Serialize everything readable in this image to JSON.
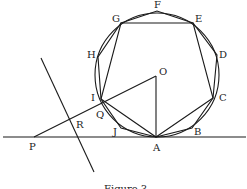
{
  "figure": {
    "caption": "Figure 3",
    "labels": {
      "F": "F",
      "G": "G",
      "E": "E",
      "H": "H",
      "D": "D",
      "O": "O",
      "I": "I",
      "C": "C",
      "Q": "Q",
      "R": "R",
      "J": "J",
      "B": "B",
      "P": "P",
      "A": "A"
    },
    "elements": [
      "circle centered at O tangent to line at A",
      "decagon A-B-C-D-E-F-G-H-I-J inscribed in circle",
      "pentagon A-C-E-G-I inscribed in circle",
      "tangent line through P and A",
      "segment P-O intersecting circle at Q",
      "segment O-A (radius)",
      "line through R crossing PO and tangent line"
    ]
  }
}
